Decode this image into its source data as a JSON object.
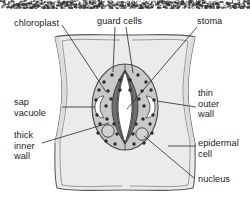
{
  "figure": {
    "background_color": "#ffffff",
    "ink_color": "#1a1a1a",
    "colors": {
      "epidermal_fill": "#ebebeb",
      "epidermal_fill_shadow": "#dcdcdc",
      "guard_cell_fill": "#c9c9c9",
      "thick_inner_wall": "#6f6f6f",
      "pore_fill": "#ffffff",
      "vacuole_fill": "#ffffff",
      "chloroplast_fill": "#2b2b2b",
      "nucleus_fill": "#d2d2d2",
      "outline": "#3a3a3a",
      "leader_line": "#2a2a2a"
    },
    "noise_band": {
      "present": true,
      "height_px": 9,
      "description": "scan-artifact speckle strip across top edge"
    }
  },
  "labels": [
    {
      "id": "chloroplast",
      "text": "chloroplast",
      "x": 14,
      "y": 18,
      "align": "left"
    },
    {
      "id": "guard-cells",
      "text": "guard cells",
      "x": 97,
      "y": 16,
      "align": "left"
    },
    {
      "id": "stoma",
      "text": "stoma",
      "x": 197,
      "y": 16,
      "align": "left"
    },
    {
      "id": "sap-vacuole",
      "text": "sap\nvacuole",
      "x": 14,
      "y": 97,
      "align": "left"
    },
    {
      "id": "thin-outer-wall",
      "text": "thin\nouter\nwall",
      "x": 198,
      "y": 88,
      "align": "left"
    },
    {
      "id": "thick-inner-wall",
      "text": "thick\ninner\nwall",
      "x": 14,
      "y": 130,
      "align": "left"
    },
    {
      "id": "epidermal-cell",
      "text": "epidermal\ncell",
      "x": 198,
      "y": 138,
      "align": "left"
    },
    {
      "id": "nucleus",
      "text": "nucleus",
      "x": 198,
      "y": 174,
      "align": "left"
    }
  ],
  "structures": [
    {
      "id": "epidermal-cell",
      "name": "epidermal cell",
      "shape": "rounded pillow square with concave sides and four lobed corners"
    },
    {
      "id": "guard-cell-pair",
      "name": "guard cells",
      "shape": "vertical oval divided into left and right halves"
    },
    {
      "id": "stoma-pore",
      "name": "stoma",
      "shape": "lens / almond shaped central opening"
    },
    {
      "id": "thick-inner-wall",
      "name": "thick inner wall",
      "shape": "dark crescent walls bordering the pore"
    },
    {
      "id": "thin-outer-wall",
      "name": "thin outer wall",
      "shape": "thin outer boundary of guard cell oval"
    },
    {
      "id": "sap-vacuole-left",
      "name": "sap vacuole",
      "shape": "white crescent, left guard cell"
    },
    {
      "id": "sap-vacuole-right",
      "name": "sap vacuole",
      "shape": "white crescent, right guard cell"
    },
    {
      "id": "nucleus-left",
      "name": "nucleus",
      "shape": "circle, lower left guard cell"
    },
    {
      "id": "nucleus-right",
      "name": "nucleus",
      "shape": "circle, lower right guard cell"
    },
    {
      "id": "chloroplasts",
      "name": "chloroplast",
      "shape": "scattered dark dots in guard cell cytoplasm",
      "count": 34
    }
  ],
  "leader_lines": [
    {
      "from": "chloroplast",
      "to": "chloroplast-dot-upper-left"
    },
    {
      "from": "guard-cells",
      "to": "guard-cell-left-top"
    },
    {
      "from": "guard-cells",
      "to": "guard-cell-right-top"
    },
    {
      "from": "stoma",
      "to": "stoma-pore-center"
    },
    {
      "from": "sap-vacuole",
      "to": "sap-vacuole-left"
    },
    {
      "from": "thin-outer-wall",
      "to": "guard-cell-outer-edge-right"
    },
    {
      "from": "thick-inner-wall",
      "to": "thick-inner-wall-left"
    },
    {
      "from": "epidermal-cell",
      "to": "epidermal-cell-body-right"
    },
    {
      "from": "nucleus",
      "to": "nucleus-right"
    }
  ]
}
